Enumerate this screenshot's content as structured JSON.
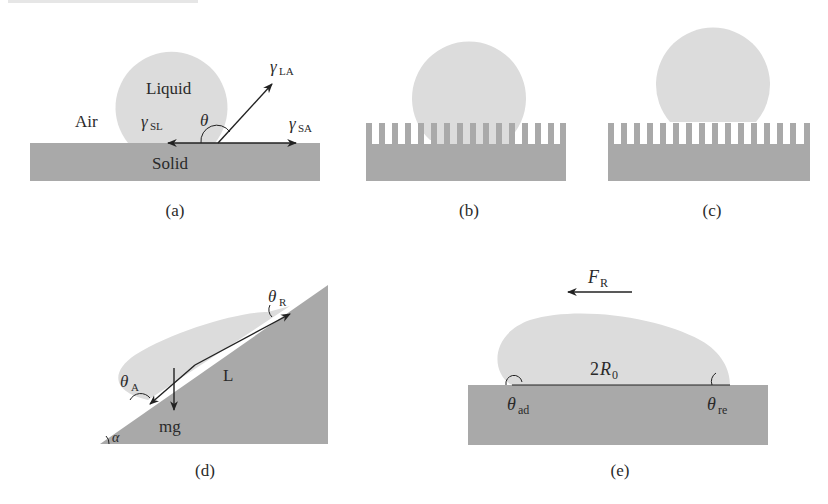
{
  "colors": {
    "solid": "#a9a9a9",
    "liquid": "#dcdcdc",
    "line": "#222222",
    "background": "#ffffff"
  },
  "panels": {
    "a": {
      "caption": "(a)",
      "labels": {
        "liquid": "Liquid",
        "air": "Air",
        "solid": "Solid",
        "theta": "θ",
        "gamma": "γ",
        "sub_la": "LA",
        "sub_sl": "SL",
        "sub_sa": "SA"
      }
    },
    "b": {
      "caption": "(b)"
    },
    "c": {
      "caption": "(c)"
    },
    "d": {
      "caption": "(d)",
      "labels": {
        "theta": "θ",
        "sub_r": "R",
        "sub_a": "A",
        "length": "L",
        "weight": "mg",
        "alpha": "α"
      }
    },
    "e": {
      "caption": "(e)",
      "labels": {
        "force": "F",
        "sub_force": "R",
        "diameter_prefix": "2",
        "radius": "R",
        "sub_radius": "0",
        "theta": "θ",
        "sub_ad": "ad",
        "sub_re": "re"
      }
    }
  }
}
